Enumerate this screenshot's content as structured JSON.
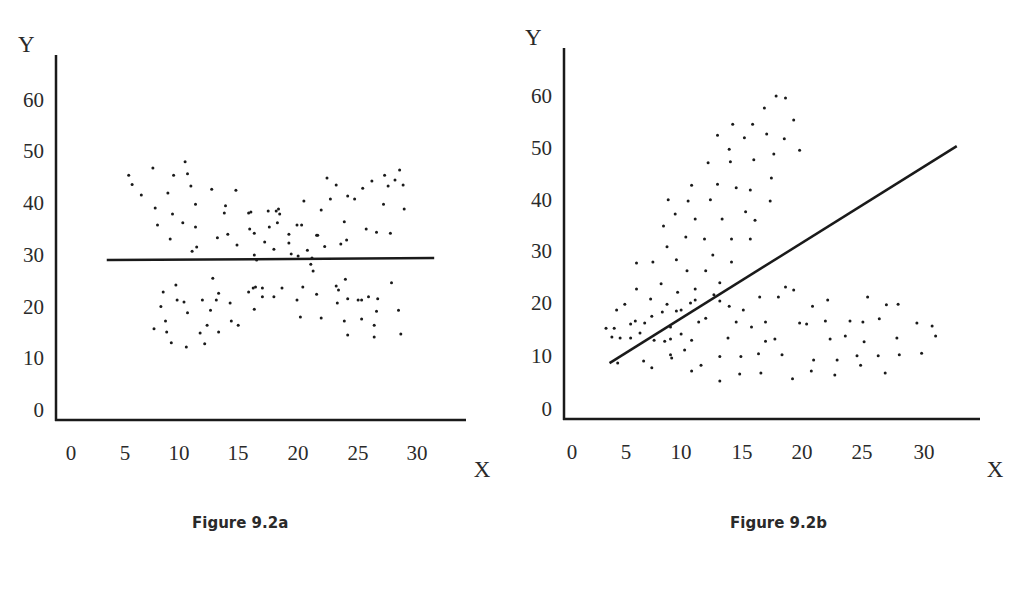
{
  "chart_data": [
    {
      "type": "scatter",
      "title": "Figure 9.2a",
      "xlabel": "X",
      "ylabel": "Y",
      "x_ticks": [
        "0",
        "5",
        "10",
        "15",
        "20",
        "25",
        "30"
      ],
      "y_ticks": [
        "0",
        "10",
        "20",
        "30",
        "40",
        "50",
        "60"
      ],
      "xlim": [
        0,
        34
      ],
      "ylim": [
        0,
        66
      ],
      "grid": false,
      "legend": null,
      "regression_line": {
        "x1": 3.1,
        "y1": 29.0,
        "x2": 31.5,
        "y2": 29.4
      },
      "points": [
        [
          5.0,
          45.4
        ],
        [
          5.3,
          43.6
        ],
        [
          6.1,
          41.6
        ],
        [
          7.1,
          46.8
        ],
        [
          7.3,
          39.1
        ],
        [
          7.5,
          35.8
        ],
        [
          8.4,
          42.0
        ],
        [
          8.6,
          33.1
        ],
        [
          8.8,
          37.9
        ],
        [
          8.9,
          45.4
        ],
        [
          9.7,
          36.2
        ],
        [
          9.9,
          48.0
        ],
        [
          10.1,
          45.7
        ],
        [
          10.4,
          43.3
        ],
        [
          10.8,
          39.8
        ],
        [
          10.8,
          35.4
        ],
        [
          10.5,
          30.7
        ],
        [
          10.9,
          31.5
        ],
        [
          12.2,
          42.7
        ],
        [
          12.7,
          33.3
        ],
        [
          13.4,
          39.5
        ],
        [
          13.3,
          38.1
        ],
        [
          13.6,
          34.0
        ],
        [
          14.3,
          42.5
        ],
        [
          14.4,
          31.9
        ],
        [
          15.4,
          38.1
        ],
        [
          15.5,
          35.0
        ],
        [
          15.6,
          38.3
        ],
        [
          15.9,
          34.2
        ],
        [
          15.9,
          30.0
        ],
        [
          16.1,
          29.0
        ],
        [
          16.8,
          32.5
        ],
        [
          17.1,
          38.5
        ],
        [
          17.2,
          35.4
        ],
        [
          17.6,
          31.1
        ],
        [
          17.8,
          38.5
        ],
        [
          17.9,
          36.2
        ],
        [
          18.0,
          38.9
        ],
        [
          18.1,
          37.9
        ],
        [
          18.9,
          34.0
        ],
        [
          18.9,
          32.3
        ],
        [
          19.1,
          30.2
        ],
        [
          19.6,
          35.8
        ],
        [
          19.7,
          29.8
        ],
        [
          20.0,
          35.8
        ],
        [
          20.2,
          40.4
        ],
        [
          20.5,
          30.9
        ],
        [
          20.8,
          28.2
        ],
        [
          20.9,
          29.4
        ],
        [
          21.0,
          26.9
        ],
        [
          21.3,
          33.8
        ],
        [
          21.4,
          33.8
        ],
        [
          21.7,
          38.7
        ],
        [
          22.0,
          31.6
        ],
        [
          22.2,
          44.9
        ],
        [
          22.5,
          40.8
        ],
        [
          23.0,
          43.5
        ],
        [
          23.4,
          32.1
        ],
        [
          23.7,
          36.4
        ],
        [
          23.8,
          25.3
        ],
        [
          24.0,
          41.4
        ],
        [
          23.9,
          32.9
        ],
        [
          24.6,
          40.8
        ],
        [
          25.3,
          42.9
        ],
        [
          25.6,
          35.0
        ],
        [
          26.1,
          44.3
        ],
        [
          26.5,
          34.4
        ],
        [
          27.1,
          39.8
        ],
        [
          27.2,
          45.4
        ],
        [
          27.5,
          43.3
        ],
        [
          27.7,
          34.2
        ],
        [
          28.1,
          44.5
        ],
        [
          28.5,
          46.4
        ],
        [
          28.8,
          43.5
        ],
        [
          28.9,
          38.9
        ],
        [
          7.2,
          15.7
        ],
        [
          7.8,
          20.0
        ],
        [
          8.3,
          15.1
        ],
        [
          8.0,
          22.8
        ],
        [
          8.2,
          17.2
        ],
        [
          9.2,
          21.3
        ],
        [
          8.7,
          13.0
        ],
        [
          9.1,
          24.2
        ],
        [
          9.8,
          20.9
        ],
        [
          10.1,
          18.8
        ],
        [
          11.2,
          14.9
        ],
        [
          11.4,
          21.3
        ],
        [
          10.0,
          12.2
        ],
        [
          11.6,
          12.8
        ],
        [
          11.8,
          16.4
        ],
        [
          12.3,
          25.5
        ],
        [
          12.1,
          19.3
        ],
        [
          12.6,
          21.3
        ],
        [
          12.8,
          22.6
        ],
        [
          12.8,
          15.1
        ],
        [
          13.8,
          20.7
        ],
        [
          13.9,
          17.2
        ],
        [
          14.5,
          16.4
        ],
        [
          15.4,
          22.8
        ],
        [
          15.8,
          23.6
        ],
        [
          15.9,
          19.5
        ],
        [
          16.0,
          23.8
        ],
        [
          16.6,
          23.6
        ],
        [
          16.6,
          21.9
        ],
        [
          17.6,
          21.9
        ],
        [
          18.3,
          23.6
        ],
        [
          19.6,
          21.3
        ],
        [
          19.9,
          18.0
        ],
        [
          20.1,
          23.8
        ],
        [
          21.3,
          22.4
        ],
        [
          21.7,
          17.8
        ],
        [
          23.0,
          24.0
        ],
        [
          23.1,
          20.7
        ],
        [
          23.2,
          23.2
        ],
        [
          24.0,
          14.5
        ],
        [
          24.0,
          21.5
        ],
        [
          23.7,
          17.2
        ],
        [
          24.9,
          21.3
        ],
        [
          25.2,
          17.6
        ],
        [
          25.2,
          21.3
        ],
        [
          25.8,
          21.9
        ],
        [
          26.3,
          14.1
        ],
        [
          26.3,
          16.4
        ],
        [
          26.5,
          19.1
        ],
        [
          26.6,
          21.5
        ],
        [
          27.8,
          24.6
        ],
        [
          28.4,
          19.3
        ],
        [
          28.6,
          14.7
        ]
      ]
    },
    {
      "type": "scatter",
      "title": "Figure 9.2b",
      "xlabel": "X",
      "ylabel": "Y",
      "x_ticks": [
        "0",
        "5",
        "10",
        "15",
        "20",
        "25",
        "30"
      ],
      "y_ticks": [
        "0",
        "10",
        "20",
        "30",
        "40",
        "50",
        "60"
      ],
      "xlim": [
        0,
        35
      ],
      "ylim": [
        0,
        69
      ],
      "grid": false,
      "legend": null,
      "regression_line": {
        "x1": 3.2,
        "y1": 8.6,
        "x2": 32.8,
        "y2": 50.2
      },
      "points": [
        [
          17.4,
          59.8
        ],
        [
          18.2,
          59.4
        ],
        [
          16.4,
          57.5
        ],
        [
          18.9,
          55.2
        ],
        [
          13.7,
          54.4
        ],
        [
          15.4,
          54.4
        ],
        [
          12.4,
          52.3
        ],
        [
          14.7,
          51.8
        ],
        [
          16.6,
          52.5
        ],
        [
          18.1,
          51.6
        ],
        [
          13.4,
          49.6
        ],
        [
          17.2,
          48.7
        ],
        [
          19.4,
          49.4
        ],
        [
          11.6,
          47.0
        ],
        [
          13.5,
          47.2
        ],
        [
          15.5,
          47.6
        ],
        [
          17.0,
          44.1
        ],
        [
          10.2,
          42.7
        ],
        [
          12.4,
          42.9
        ],
        [
          14.0,
          42.2
        ],
        [
          15.2,
          41.8
        ],
        [
          16.9,
          39.7
        ],
        [
          8.2,
          39.9
        ],
        [
          9.9,
          39.7
        ],
        [
          11.8,
          39.9
        ],
        [
          8.8,
          37.2
        ],
        [
          10.5,
          36.2
        ],
        [
          12.8,
          36.2
        ],
        [
          14.8,
          37.6
        ],
        [
          15.6,
          36.0
        ],
        [
          7.8,
          34.9
        ],
        [
          9.7,
          32.8
        ],
        [
          11.3,
          32.4
        ],
        [
          13.6,
          32.4
        ],
        [
          15.2,
          32.4
        ],
        [
          8.1,
          30.9
        ],
        [
          12.0,
          29.3
        ],
        [
          8.9,
          28.4
        ],
        [
          13.6,
          28.0
        ],
        [
          5.5,
          27.8
        ],
        [
          6.9,
          28.0
        ],
        [
          9.8,
          26.3
        ],
        [
          11.4,
          26.3
        ],
        [
          7.6,
          23.8
        ],
        [
          12.6,
          24.0
        ],
        [
          5.5,
          22.8
        ],
        [
          10.5,
          22.8
        ],
        [
          6.7,
          20.9
        ],
        [
          9.0,
          22.2
        ],
        [
          12.1,
          21.7
        ],
        [
          18.2,
          23.2
        ],
        [
          16.0,
          21.3
        ],
        [
          2.9,
          15.3
        ],
        [
          3.4,
          13.6
        ],
        [
          5.0,
          16.1
        ],
        [
          5.8,
          14.4
        ],
        [
          6.8,
          17.6
        ],
        [
          8.4,
          15.5
        ],
        [
          9.3,
          18.8
        ],
        [
          10.5,
          20.7
        ],
        [
          12.6,
          20.5
        ],
        [
          13.4,
          19.5
        ],
        [
          14.6,
          18.8
        ],
        [
          17.6,
          21.3
        ],
        [
          18.9,
          22.6
        ],
        [
          20.5,
          19.5
        ],
        [
          21.8,
          20.7
        ],
        [
          25.2,
          21.3
        ],
        [
          26.8,
          19.8
        ],
        [
          27.8,
          19.9
        ],
        [
          3.8,
          18.8
        ],
        [
          4.1,
          13.4
        ],
        [
          4.5,
          19.9
        ],
        [
          5.4,
          16.7
        ],
        [
          6.2,
          16.3
        ],
        [
          7.7,
          18.4
        ],
        [
          8.1,
          19.9
        ],
        [
          10.1,
          20.1
        ],
        [
          8.9,
          18.6
        ],
        [
          10.8,
          16.5
        ],
        [
          11.4,
          17.2
        ],
        [
          14.0,
          16.5
        ],
        [
          15.3,
          15.5
        ],
        [
          16.5,
          16.5
        ],
        [
          19.4,
          16.3
        ],
        [
          20.0,
          16.1
        ],
        [
          21.6,
          16.7
        ],
        [
          23.7,
          16.7
        ],
        [
          24.8,
          16.5
        ],
        [
          26.2,
          17.1
        ],
        [
          29.4,
          16.3
        ],
        [
          30.7,
          15.7
        ],
        [
          31.0,
          13.8
        ],
        [
          3.6,
          15.3
        ],
        [
          5.0,
          13.4
        ],
        [
          7.0,
          13.0
        ],
        [
          7.9,
          12.8
        ],
        [
          8.4,
          13.2
        ],
        [
          9.3,
          14.2
        ],
        [
          10.2,
          13.0
        ],
        [
          13.3,
          13.4
        ],
        [
          16.5,
          12.8
        ],
        [
          17.3,
          13.2
        ],
        [
          22.0,
          13.2
        ],
        [
          23.3,
          13.8
        ],
        [
          24.9,
          12.7
        ],
        [
          27.7,
          13.4
        ],
        [
          3.9,
          8.6
        ],
        [
          6.1,
          9.0
        ],
        [
          6.8,
          7.7
        ],
        [
          8.4,
          10.2
        ],
        [
          8.5,
          9.6
        ],
        [
          9.6,
          11.1
        ],
        [
          11.0,
          8.2
        ],
        [
          12.6,
          9.9
        ],
        [
          14.4,
          9.9
        ],
        [
          15.9,
          10.4
        ],
        [
          17.9,
          10.2
        ],
        [
          20.6,
          9.2
        ],
        [
          22.6,
          9.2
        ],
        [
          24.3,
          10.0
        ],
        [
          26.1,
          10.0
        ],
        [
          27.9,
          10.2
        ],
        [
          29.8,
          10.5
        ],
        [
          10.2,
          7.1
        ],
        [
          12.6,
          5.2
        ],
        [
          14.3,
          6.5
        ],
        [
          16.1,
          6.7
        ],
        [
          18.8,
          5.6
        ],
        [
          20.4,
          7.1
        ],
        [
          22.4,
          6.3
        ],
        [
          24.6,
          8.2
        ],
        [
          26.7,
          6.7
        ]
      ]
    }
  ],
  "figures": {
    "a": {
      "caption": "Figure 9.2a",
      "x_label": "X",
      "y_label": "Y",
      "x_ticks": [
        "0",
        "5",
        "10",
        "15",
        "20",
        "25",
        "30"
      ],
      "y_ticks": [
        "0",
        "10",
        "20",
        "30",
        "40",
        "50",
        "60"
      ]
    },
    "b": {
      "caption": "Figure 9.2b",
      "x_label": "X",
      "y_label": "Y",
      "x_ticks": [
        "0",
        "5",
        "10",
        "15",
        "20",
        "25",
        "30"
      ],
      "y_ticks": [
        "0",
        "10",
        "20",
        "30",
        "40",
        "50",
        "60"
      ]
    }
  },
  "colors": {
    "ink": "#1a1a1a",
    "background": "#ffffff"
  }
}
